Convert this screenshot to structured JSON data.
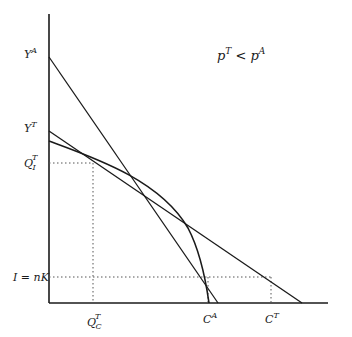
{
  "diagram": {
    "title_condition": {
      "base": "p",
      "sup1": "T",
      "op": " < ",
      "base2": "p",
      "sup2": "A"
    },
    "axes": {
      "origin": [
        49,
        303
      ],
      "y_top": 14,
      "x_right": 328
    },
    "y_labels": [
      {
        "id": "YA",
        "base": "Y",
        "sup": "A",
        "y": 57
      },
      {
        "id": "YT",
        "base": "Y",
        "sup": "T",
        "y": 131
      },
      {
        "id": "QIT",
        "base": "Q",
        "sup": "T",
        "sub": "I",
        "y": 163
      },
      {
        "id": "InK",
        "text": "I = nK",
        "y": 277
      }
    ],
    "x_labels": [
      {
        "id": "QCT",
        "base": "Q",
        "sup": "T",
        "sub": "C",
        "x": 93
      },
      {
        "id": "CA",
        "base": "C",
        "sup": "A",
        "x": 208
      },
      {
        "id": "CT",
        "base": "C",
        "sup": "T",
        "x": 271
      }
    ],
    "lines": {
      "autarky_price_line": {
        "from": [
          49,
          57
        ],
        "to": [
          218,
          303
        ]
      },
      "trade_price_line": {
        "from": [
          49,
          131
        ],
        "to": [
          302,
          303
        ]
      }
    },
    "ppf_curve": {
      "start": [
        49,
        141
      ],
      "ctrl": [
        150,
        185
      ],
      "end": [
        209,
        303
      ]
    },
    "colors": {
      "ink": "#1a1a1a",
      "dotted": "#555555",
      "background": "#ffffff"
    }
  }
}
